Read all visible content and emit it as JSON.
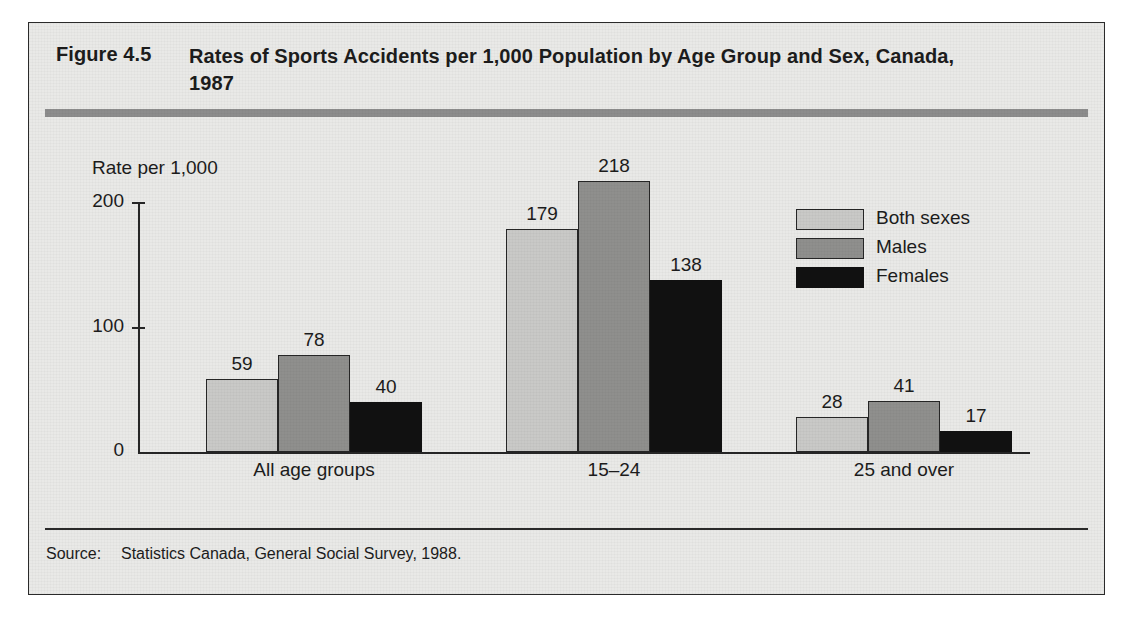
{
  "figure": {
    "label": "Figure 4.5",
    "title": "Rates of Sports Accidents per 1,000 Population by Age Group and Sex, Canada, 1987",
    "source_label": "Source:",
    "source_text": "Statistics Canada, General Social Survey, 1988."
  },
  "colors": {
    "panel_bg": "#e9e9e7",
    "rule": "#8c8c8c",
    "both_sexes": "#c9c9c7",
    "males": "#8f8f8d",
    "females": "#111111",
    "ink": "#1c1c1c"
  },
  "chart_data": {
    "type": "bar",
    "title": "Rates of Sports Accidents per 1,000 Population by Age Group and Sex, Canada, 1987",
    "xlabel": "",
    "ylabel": "Rate per 1,000",
    "ylim": [
      0,
      200
    ],
    "yticks": [
      0,
      100,
      200
    ],
    "ytick_labels": [
      "0",
      "100",
      "200"
    ],
    "grid": false,
    "legend_position": "upper right",
    "categories": [
      "All age groups",
      "15–24",
      "25 and over"
    ],
    "series": [
      {
        "name": "Both sexes",
        "values": [
          59,
          179,
          28
        ]
      },
      {
        "name": "Males",
        "values": [
          78,
          218,
          41
        ]
      },
      {
        "name": "Females",
        "values": [
          40,
          138,
          17
        ]
      }
    ],
    "data_labels": [
      "59",
      "78",
      "40",
      "179",
      "218",
      "138",
      "28",
      "41",
      "17"
    ]
  },
  "legend": {
    "items": [
      {
        "label": "Both sexes"
      },
      {
        "label": "Males"
      },
      {
        "label": "Females"
      }
    ]
  }
}
